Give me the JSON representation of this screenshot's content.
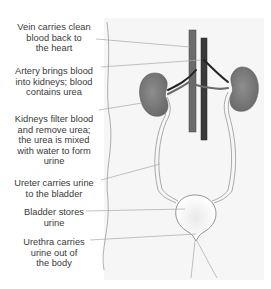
{
  "diagram": {
    "labels": [
      {
        "id": "vein",
        "text_lines": [
          "Vein carries clean",
          "blood back to",
          "the heart"
        ]
      },
      {
        "id": "artery",
        "text_lines": [
          "Artery brings blood",
          "into kidneys; blood",
          "contains urea"
        ]
      },
      {
        "id": "kidneys",
        "text_lines": [
          "Kidneys filter blood",
          "and remove urea;",
          "the urea is mixed",
          "with water to form",
          "urine"
        ]
      },
      {
        "id": "ureter",
        "text_lines": [
          "Ureter carries urine",
          "to the bladder"
        ]
      },
      {
        "id": "bladder",
        "text_lines": [
          "Bladder stores",
          "urine"
        ]
      },
      {
        "id": "urethra",
        "text_lines": [
          "Urethra carries",
          "urine out of",
          "the body"
        ]
      }
    ],
    "colors": {
      "kidney": "#7d7d7d",
      "vein": "#6b6b6b",
      "artery": "#2a2a2a",
      "outline": "#888888",
      "leader_line": "#a8a8a8",
      "text": "#3a3a3a",
      "panel": "#f6f6f6"
    }
  }
}
